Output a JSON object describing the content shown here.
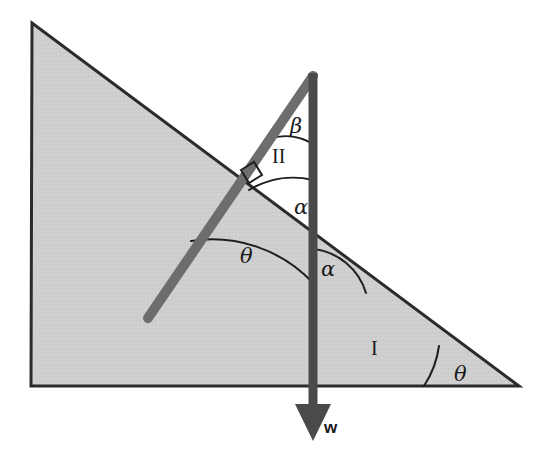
{
  "figure": {
    "type": "geometry-diagram",
    "canvas": {
      "width": 536,
      "height": 467,
      "background": "#ffffff"
    }
  },
  "colors": {
    "wedge_fill": "#cfcfcf",
    "wedge_stroke": "#2b2b2b",
    "rod": "#6d6d6d",
    "weight_vector": "#4a4a4a",
    "arc_stroke": "#1f1f1f",
    "label_text": "#1a1a1a"
  },
  "shapes": {
    "wedge": {
      "name": "inclined-plane-triangle",
      "points": "32,23 31,386 519,386",
      "fill": "#cfcfcf",
      "stroke": "#2b2b2b",
      "stroke_width": 3
    },
    "rod": {
      "name": "rod",
      "x1": 313,
      "y1": 76,
      "x2": 148,
      "y2": 318,
      "stroke": "#6d6d6d",
      "stroke_width": 10
    },
    "weight_vector": {
      "name": "weight-vector",
      "x1": 313,
      "y1": 73,
      "x2": 313,
      "y2": 412,
      "stroke": "#4a4a4a",
      "stroke_width": 9,
      "arrowhead": "295,404 331,404 313,441"
    },
    "right_angle_marker": {
      "name": "right-angle-marker",
      "points": "241,170 254,162 262,175 249,183",
      "stroke": "#1f1f1f",
      "stroke_width": 2
    }
  },
  "arcs": [
    {
      "name": "arc-beta",
      "label_key": "beta_top",
      "path": "M 268,139 A 54,54 0 0 1 313,144",
      "stroke_width": 2
    },
    {
      "name": "arc-alpha-upper",
      "label_key": "alpha_upper",
      "path": "M 249,190 A 86,86 0 0 1 313,180",
      "stroke_width": 2
    },
    {
      "name": "arc-theta-rod",
      "label_key": "theta_rod",
      "path": "M 191,241 A 138,138 0 0 1 313,283",
      "stroke_width": 2
    },
    {
      "name": "arc-alpha-lower",
      "label_key": "alpha_lower",
      "path": "M 313,249 A 62,62 0 0 1 366,293",
      "stroke_width": 2
    },
    {
      "name": "arc-theta-base",
      "label_key": "theta_base",
      "path": "M 439,346 A 96,96 0 0 1 424,386",
      "stroke_width": 2
    }
  ],
  "labels": {
    "beta_top": {
      "text": "β",
      "x": 290,
      "y": 116,
      "class": "greek",
      "name": "angle-label-beta"
    },
    "region_two": {
      "text": "II",
      "x": 272,
      "y": 146,
      "class": "roman",
      "name": "region-label-two"
    },
    "alpha_upper": {
      "text": "α",
      "x": 294,
      "y": 197,
      "class": "greek",
      "name": "angle-label-alpha-upper"
    },
    "theta_rod": {
      "text": "θ",
      "x": 240,
      "y": 246,
      "class": "greek",
      "name": "angle-label-theta-rod"
    },
    "alpha_lower": {
      "text": "α",
      "x": 321,
      "y": 259,
      "class": "greek",
      "name": "angle-label-alpha-lower"
    },
    "region_one": {
      "text": "I",
      "x": 371,
      "y": 338,
      "class": "roman",
      "name": "region-label-one"
    },
    "theta_base": {
      "text": "θ",
      "x": 454,
      "y": 364,
      "class": "greek",
      "name": "angle-label-theta-base"
    },
    "weight": {
      "text": "w",
      "x": 324,
      "y": 419,
      "class": "vecw",
      "name": "weight-vector-label"
    }
  }
}
